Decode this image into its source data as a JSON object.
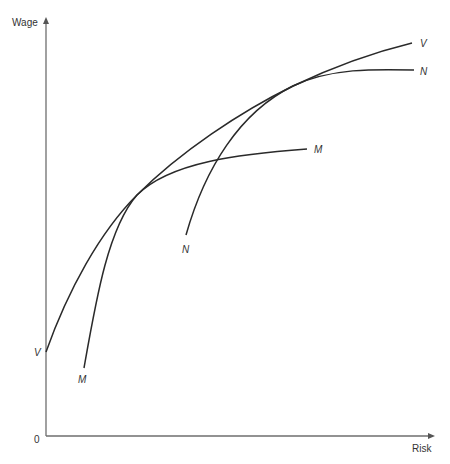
{
  "diagram": {
    "type": "economics-curves",
    "axes": {
      "y_label": "Wage",
      "x_label": "Risk",
      "origin_label": "0"
    },
    "curves": [
      {
        "id": "V",
        "label_start": "V",
        "label_end": "V",
        "description": "Envelope (market wage-risk locus) tangent to M and N"
      },
      {
        "id": "M",
        "label_start": "M",
        "label_end": "M",
        "description": "Indifference/offer curve tangent to V at lower risk"
      },
      {
        "id": "N",
        "label_start": "N",
        "label_end": "N",
        "description": "Indifference/offer curve tangent to V at higher risk"
      }
    ],
    "colors": {
      "curve": "#2a2a2a",
      "axis": "#6e6e6e",
      "background": "#ffffff"
    }
  }
}
